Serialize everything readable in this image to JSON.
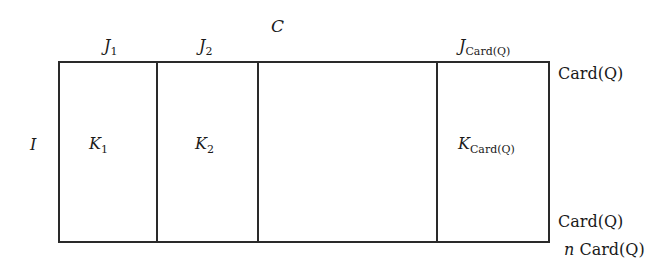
{
  "diagram": {
    "title": "C",
    "row_label": "I",
    "columns": [
      {
        "header_base": "J",
        "header_sub": "1",
        "cell_base": "K",
        "cell_sub": "1"
      },
      {
        "header_base": "J",
        "header_sub": "2",
        "cell_base": "K",
        "cell_sub": "2"
      },
      {
        "header_base": "",
        "header_sub": "",
        "cell_base": "",
        "cell_sub": ""
      },
      {
        "header_base": "J",
        "header_sub": "Card(Q)",
        "cell_base": "K",
        "cell_sub": "Card(Q)"
      }
    ],
    "right_labels": {
      "top": "Card(Q)",
      "bottom_upper": "Card(Q)",
      "bottom_lower_prefix": "n",
      "bottom_lower": "Card(Q)"
    },
    "colors": {
      "stroke": "#2a2a2a",
      "background": "#ffffff",
      "text": "#1a1a1a"
    }
  }
}
